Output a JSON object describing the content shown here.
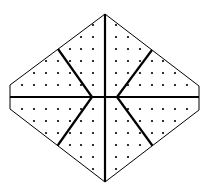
{
  "diagram": {
    "type": "dot-grid hexagon divided into six regions",
    "background": "#ffffff",
    "stroke_color": "#000000",
    "dot_color": "#000000",
    "outline": [
      [
        105,
        14
      ],
      [
        199,
        86
      ],
      [
        199,
        110
      ],
      [
        105,
        182
      ],
      [
        10,
        109
      ],
      [
        10,
        85
      ]
    ],
    "center": [
      105,
      97
    ],
    "inner_left": [
      92,
      97
    ],
    "inner_right": [
      117,
      97
    ],
    "spokes": [
      {
        "from": [
          92,
          97
        ],
        "to": [
          58,
          49
        ]
      },
      {
        "from": [
          117,
          97
        ],
        "to": [
          152,
          50
        ]
      },
      {
        "from": [
          92,
          97
        ],
        "to": [
          58,
          145
        ]
      },
      {
        "from": [
          117,
          97
        ],
        "to": [
          152,
          145
        ]
      }
    ],
    "axis_lines": [
      {
        "from": [
          105,
          14
        ],
        "to": [
          105,
          182
        ]
      },
      {
        "from": [
          10,
          97
        ],
        "to": [
          199,
          97
        ]
      }
    ],
    "grid": {
      "x_left": [
        22,
        34,
        46,
        58,
        70,
        81,
        93
      ],
      "x_right": [
        116,
        128,
        140,
        152,
        163,
        175,
        187
      ],
      "y_rows": [
        25,
        37,
        49,
        61,
        73,
        85,
        109,
        121,
        133,
        145,
        157,
        169
      ],
      "spacing": 11.7
    },
    "regions": 6
  }
}
